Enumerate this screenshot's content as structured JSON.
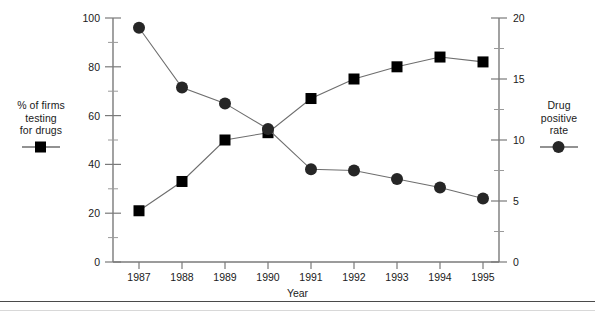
{
  "chart_data": {
    "type": "line",
    "title": "",
    "subtitle": "",
    "xlabel": "Year",
    "ylabel_left": "% of firms testing for drugs",
    "ylabel_right": "Drug positive rate",
    "categories": [
      "1987",
      "1988",
      "1989",
      "1990",
      "1991",
      "1992",
      "1993",
      "1994",
      "1995"
    ],
    "x": [
      1987,
      1988,
      1989,
      1990,
      1991,
      1992,
      1993,
      1994,
      1995
    ],
    "grid": false,
    "legend_position": "outside-left-and-right",
    "axes": {
      "left": {
        "label": "% of firms testing for drugs",
        "min": 0,
        "max": 100,
        "major_step": 20,
        "minor_step": 10,
        "ticks": [
          "0",
          "20",
          "40",
          "60",
          "80",
          "100"
        ],
        "tick_values": [
          0,
          20,
          40,
          60,
          80,
          100
        ]
      },
      "right": {
        "label": "Drug positive rate",
        "min": 0,
        "max": 20,
        "major_step": 5,
        "minor_step": 2.5,
        "ticks": [
          "0",
          "5",
          "10",
          "15",
          "20"
        ],
        "tick_values": [
          0,
          5,
          10,
          15,
          20
        ]
      },
      "x": {
        "label": "Year",
        "ticks": [
          "1987",
          "1988",
          "1989",
          "1990",
          "1991",
          "1992",
          "1993",
          "1994",
          "1995"
        ]
      }
    },
    "series": [
      {
        "name": "% of firms testing for drugs",
        "axis": "left",
        "marker": "square",
        "color": "#000000",
        "values": [
          21,
          33,
          50,
          53,
          67,
          75,
          80,
          84,
          82
        ]
      },
      {
        "name": "Drug positive rate",
        "axis": "right",
        "marker": "circle",
        "color": "#262626",
        "values": [
          19.2,
          14.3,
          13.0,
          10.9,
          7.6,
          7.5,
          6.8,
          6.1,
          5.2
        ]
      }
    ]
  },
  "legend_left": {
    "line1": "% of firms",
    "line2": "testing",
    "line3": "for drugs",
    "marker": "square-marker"
  },
  "legend_right": {
    "line1": "Drug",
    "line2": "positive",
    "line3": "rate",
    "marker": "circle-marker"
  },
  "xaxis_title": "Year",
  "colors": {
    "axis": "#7a7a7a",
    "series_square": "#000000",
    "series_circle": "#262626",
    "text": "#1a1a1a",
    "rule": "#4a4a4a",
    "background": "#ffffff"
  }
}
